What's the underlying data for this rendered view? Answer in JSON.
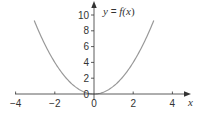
{
  "chart_data": {
    "type": "line",
    "title": "",
    "function_label": "y = f(x)",
    "function_label_parts": {
      "lhs": "y",
      "eq": " = ",
      "f": "f(",
      "x": "x",
      "close": ")"
    },
    "xlabel": "x",
    "ylabel": "",
    "xlim": [
      -4,
      4.7
    ],
    "ylim": [
      0,
      11.5
    ],
    "x_ticks": [
      -4,
      -2,
      0,
      2,
      4
    ],
    "x_tick_labels": [
      "−4",
      "−2",
      "0",
      "2",
      "4"
    ],
    "y_ticks": [
      0,
      2,
      4,
      6,
      8,
      10
    ],
    "y_tick_labels": [
      "0",
      "2",
      "4",
      "6",
      "8",
      "10"
    ],
    "grid": false,
    "legend": null,
    "series": [
      {
        "name": "y = f(x)",
        "formula": "y = x^2",
        "x": [
          -3,
          -2.5,
          -2,
          -1.5,
          -1,
          -0.5,
          0,
          0.5,
          1,
          1.5,
          2,
          2.5,
          3
        ],
        "values": [
          9,
          6.25,
          4,
          2.25,
          1,
          0.25,
          0,
          0.25,
          1,
          2.25,
          4,
          6.25,
          9
        ],
        "color": "#999999"
      }
    ]
  },
  "colors": {
    "axis": "#333333",
    "curve": "#999999",
    "text": "#333333",
    "background": "#ffffff"
  }
}
